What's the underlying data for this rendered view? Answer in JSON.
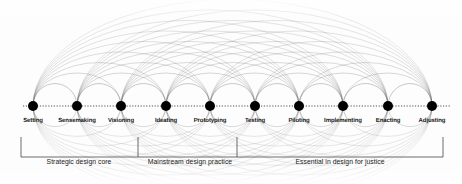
{
  "figure": {
    "type": "arc-diagram",
    "background_color": "#fdfdfd",
    "node_color": "#000000",
    "arc_color": "#555555",
    "axis_color": "#333333",
    "width": 462,
    "height": 184
  },
  "chart_data": {
    "type": "arc-diagram",
    "title": "",
    "axis_y": 106,
    "node_radius": 5,
    "nodes": [
      {
        "index": 0,
        "label": "Setting",
        "x": 33,
        "y": 106
      },
      {
        "index": 1,
        "label": "Sensemaking",
        "x": 77,
        "y": 106
      },
      {
        "index": 2,
        "label": "Visioning",
        "x": 121,
        "y": 106
      },
      {
        "index": 3,
        "label": "Ideating",
        "x": 166,
        "y": 106
      },
      {
        "index": 4,
        "label": "Prototyping",
        "x": 210,
        "y": 106
      },
      {
        "index": 5,
        "label": "Testing",
        "x": 255,
        "y": 106
      },
      {
        "index": 6,
        "label": "Piloting",
        "x": 299,
        "y": 106
      },
      {
        "index": 7,
        "label": "Implementing",
        "x": 343,
        "y": 106
      },
      {
        "index": 8,
        "label": "Enacting",
        "x": 388,
        "y": 106
      },
      {
        "index": 9,
        "label": "Adjusting",
        "x": 432,
        "y": 106
      }
    ],
    "edges_description": "fully connected: every node joined to every other node by an arc above the axis and a mirrored arc below the axis",
    "label_row_y": 118,
    "brackets": [
      {
        "id": "strategic-design-core",
        "label": "Strategic design core",
        "x_start": 21,
        "x_end": 138,
        "label_x": 79
      },
      {
        "id": "mainstream-design-practice",
        "label": "Mainstream design practice",
        "x_start": 138,
        "x_end": 237,
        "label_x": 190
      },
      {
        "id": "essential-in-design-for-justice",
        "label": "Essential in design for justice",
        "x_start": 237,
        "x_end": 443,
        "label_x": 340
      }
    ],
    "bracket_top_y": 137,
    "bracket_bottom_y": 157,
    "bracket_label_y": 158
  }
}
